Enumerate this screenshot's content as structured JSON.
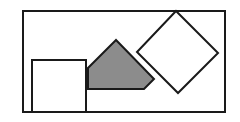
{
  "diagram": {
    "width": 240,
    "height": 122,
    "colors": {
      "background": "#ffffff",
      "stroke": "#1a1a1a",
      "shape_fill": "#ffffff",
      "shaded_fill": "#8c8c8c"
    },
    "stroke_width": 2,
    "shapes": [
      {
        "id": "outer-rectangle",
        "type": "rect",
        "x": 23,
        "y": 11,
        "w": 202,
        "h": 101,
        "fill": "none"
      },
      {
        "id": "square",
        "type": "rect",
        "x": 32,
        "y": 60,
        "w": 54,
        "h": 52,
        "fill": "white"
      },
      {
        "id": "shaded-pentagon",
        "type": "polygon",
        "points": "116,40 88,68 88,89 144,89 154,79",
        "fill": "gray"
      },
      {
        "id": "diamond",
        "type": "polygon",
        "points": "176,11 218,53 178,93 137,52",
        "fill": "white"
      }
    ]
  }
}
